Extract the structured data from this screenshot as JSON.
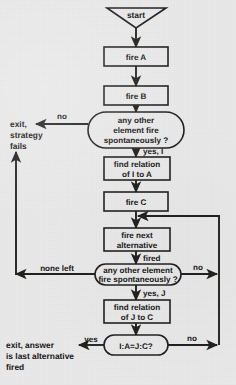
{
  "diagram": {
    "background_color": "#e9e9e9",
    "ink_color": "#20201f",
    "nodes": {
      "start": {
        "label": "start",
        "shape": "inverted-triangle"
      },
      "fire_a": {
        "label": "fire A",
        "shape": "rect"
      },
      "fire_b": {
        "label": "fire B",
        "shape": "rect"
      },
      "decision1_l1": {
        "label": "any other"
      },
      "decision1_l2": {
        "label": "element fire"
      },
      "decision1_l3": {
        "label": "spontaneously ?"
      },
      "find_rel_ia_l1": {
        "label": "find relation"
      },
      "find_rel_ia_l2": {
        "label": "of I to A"
      },
      "fire_c": {
        "label": "fire C",
        "shape": "rect"
      },
      "fire_next_l1": {
        "label": "fire next"
      },
      "fire_next_l2": {
        "label": "alternative"
      },
      "decision2_l1": {
        "label": "any other element"
      },
      "decision2_l2": {
        "label": "fire spontaneously ?"
      },
      "find_rel_jc_l1": {
        "label": "find relation"
      },
      "find_rel_jc_l2": {
        "label": "of J to C"
      },
      "proportion": {
        "label": "I:A=J:C?",
        "shape": "stadium"
      }
    },
    "terminals": {
      "exit_fail_l1": {
        "label": "exit,"
      },
      "exit_fail_l2": {
        "label": "strategy"
      },
      "exit_fail_l3": {
        "label": "fails"
      },
      "exit_answer_l1": {
        "label": "exit, answer"
      },
      "exit_answer_l2": {
        "label": "is last alternative"
      },
      "exit_answer_l3": {
        "label": "fired"
      }
    },
    "edge_labels": {
      "d1_no": "no",
      "d1_yes": "yes, I",
      "fired": "fired",
      "d2_none_left": "none left",
      "d2_no": "no",
      "d2_yes": "yes, J",
      "prop_yes": "yes",
      "prop_no": "no"
    }
  }
}
